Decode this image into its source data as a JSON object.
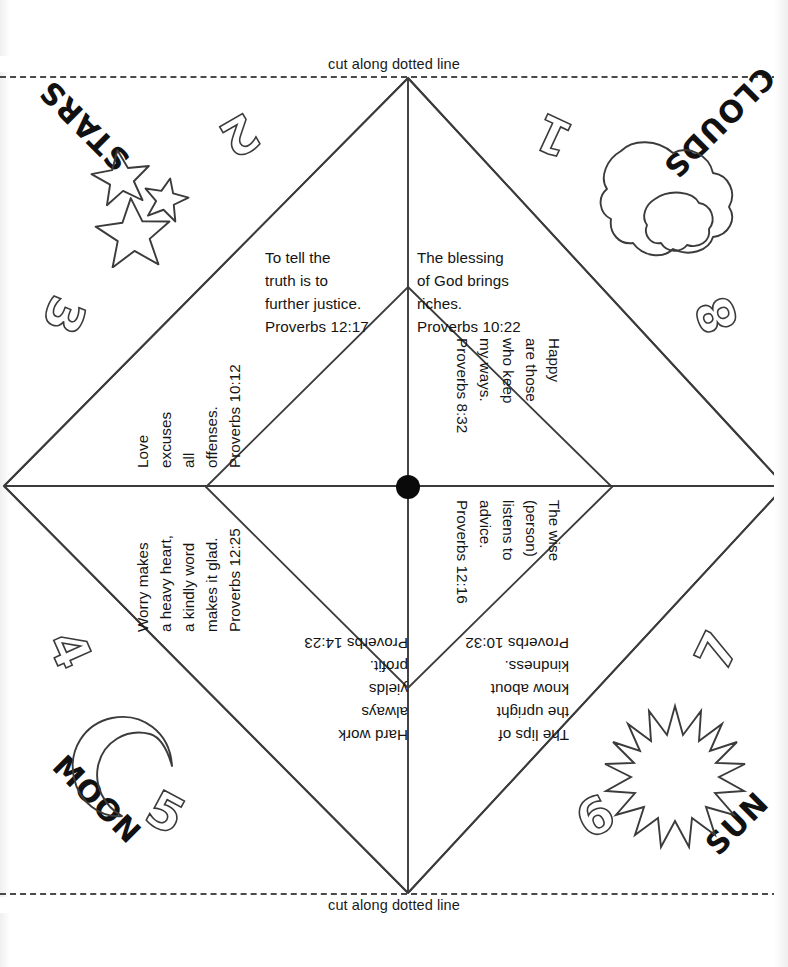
{
  "page": {
    "width": 788,
    "height": 967,
    "ink_color": "#141414",
    "paper_color": "#ffffff"
  },
  "cut_lines": {
    "top_label": "cut along dotted line",
    "bottom_label": "cut along dotted line"
  },
  "verses": {
    "top_left": "To tell the\ntruth is to\nfurther justice.\nProverbs 12:17",
    "top_right": "The blessing\nof God brings\nriches.\nProverbs 10:22",
    "right_upper": "Happy\nare those\nwho keep\nmy ways.\nProverbs 8:32",
    "right_lower": "The wise\n(person)\nlistens to\nadvice.\nProverbs 12:16",
    "bottom_right": "The lips of\nthe upright\nknow about\nkindness.\nProverbs 10:32",
    "bottom_left": "Hard work\nalways\nyields\nprofit.\nProverbs 14:23",
    "left_lower": "Worry makes\na heavy heart,\na kindly word\nmakes it glad.\nProverbs 12:25",
    "left_upper": "Love\nexcuses\nall\noffenses.\nProverbs 10:12"
  },
  "corner_words": {
    "top_left": "STARS",
    "top_right": "CLOUDS",
    "bottom_left": "MOON",
    "bottom_right": "SUN"
  },
  "numerals": {
    "n1": "1",
    "n2": "2",
    "n3": "3",
    "n4": "4",
    "n5": "5",
    "n6": "6",
    "n7": "7",
    "n8": "8"
  },
  "icons": {
    "stars": "stars-icon",
    "clouds": "cloud-icon",
    "moon": "crescent-moon-icon",
    "sun": "sun-icon",
    "center": "center-dot-icon"
  }
}
